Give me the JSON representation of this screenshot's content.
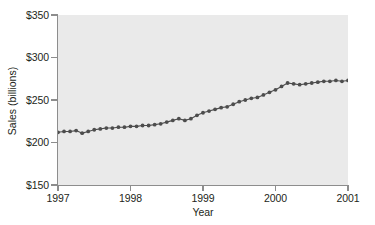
{
  "chart_data": {
    "type": "line",
    "title": "",
    "subtitle": "",
    "xlabel": "Year",
    "ylabel": "Sales (billions)",
    "xlim": [
      1997,
      2001
    ],
    "ylim": [
      150,
      350
    ],
    "grid": false,
    "legend": false,
    "legend_position": "none",
    "marker": "filled-circle",
    "series_color": "#4d4d4d",
    "panel_color": "#eaeaea",
    "axis_color": "#8d8d8d",
    "y_ticks": [
      {
        "value": 350,
        "label": "$350"
      },
      {
        "value": 300,
        "label": "$300"
      },
      {
        "value": 250,
        "label": "$250"
      },
      {
        "value": 200,
        "label": "$200"
      },
      {
        "value": 150,
        "label": "$150"
      }
    ],
    "x_ticks": [
      {
        "value": 1997,
        "label": "1997"
      },
      {
        "value": 1998,
        "label": "1998"
      },
      {
        "value": 1999,
        "label": "1999"
      },
      {
        "value": 2000,
        "label": "2000"
      },
      {
        "value": 2001,
        "label": "2001"
      }
    ],
    "series": [
      {
        "name": "Sales",
        "x": [
          1997.0,
          1997.0833,
          1997.1667,
          1997.25,
          1997.3333,
          1997.4167,
          1997.5,
          1997.5833,
          1997.6667,
          1997.75,
          1997.8333,
          1997.9167,
          1998.0,
          1998.0833,
          1998.1667,
          1998.25,
          1998.3333,
          1998.4167,
          1998.5,
          1998.5833,
          1998.6667,
          1998.75,
          1998.8333,
          1998.9167,
          1999.0,
          1999.0833,
          1999.1667,
          1999.25,
          1999.3333,
          1999.4167,
          1999.5,
          1999.5833,
          1999.6667,
          1999.75,
          1999.8333,
          1999.9167,
          2000.0,
          2000.0833,
          2000.1667,
          2000.25,
          2000.3333,
          2000.4167,
          2000.5,
          2000.5833,
          2000.6667,
          2000.75,
          2000.8333,
          2000.9167,
          2001.0
        ],
        "values": [
          212,
          213,
          213,
          214,
          211,
          213,
          215,
          216,
          217,
          217,
          218,
          218,
          219,
          219,
          220,
          220,
          221,
          222,
          224,
          226,
          228,
          226,
          228,
          232,
          235,
          237,
          239,
          241,
          242,
          245,
          248,
          250,
          252,
          253,
          256,
          259,
          262,
          266,
          270,
          269,
          268,
          269,
          270,
          271,
          272,
          272,
          273,
          272,
          273
        ]
      }
    ]
  }
}
